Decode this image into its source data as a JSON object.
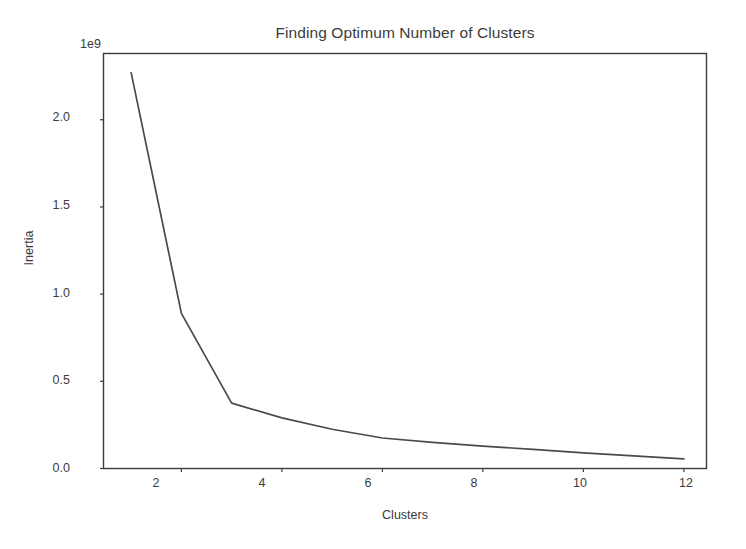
{
  "chart_data": {
    "type": "line",
    "title": "Finding Optimum Number of Clusters",
    "xlabel": "Clusters",
    "ylabel": "Inertia",
    "y_exponent_label": "1e9",
    "y_scale": 1000000000,
    "x": [
      1,
      2,
      3,
      4,
      5,
      6,
      7,
      8,
      9,
      10,
      11,
      12
    ],
    "values": [
      2270000000,
      890000000,
      375000000,
      290000000,
      225000000,
      175000000,
      150000000,
      128000000,
      110000000,
      90000000,
      72000000,
      55000000
    ],
    "series": [
      {
        "name": "Inertia",
        "values": [
          2270000000,
          890000000,
          375000000,
          290000000,
          225000000,
          175000000,
          150000000,
          128000000,
          110000000,
          90000000,
          72000000,
          55000000
        ]
      }
    ],
    "xlim": [
      0.45,
      12.45
    ],
    "ylim": [
      0,
      2.38
    ],
    "xticks": [
      2,
      4,
      6,
      8,
      10,
      12
    ],
    "xticklabels": [
      "2",
      "4",
      "6",
      "8",
      "10",
      "12"
    ],
    "yticks": [
      0.0,
      0.5,
      1.0,
      1.5,
      2.0
    ],
    "yticklabels": [
      "0.0",
      "0.5",
      "1.0",
      "1.5",
      "2.0"
    ],
    "grid": false,
    "legend": null,
    "line_color": "#4a4a4a",
    "background_color": "#ffffff",
    "axis_color": "#3b3b3b"
  }
}
